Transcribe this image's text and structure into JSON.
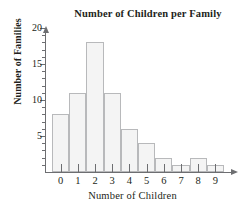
{
  "chart_data": {
    "type": "bar",
    "title": "Number of Children per Family",
    "xlabel": "Number of Children",
    "ylabel": "Number of Families",
    "categories": [
      "0",
      "1",
      "2",
      "3",
      "4",
      "5",
      "6",
      "7",
      "8",
      "9"
    ],
    "values": [
      8,
      11,
      18,
      11,
      6,
      4,
      2,
      1,
      2,
      1
    ],
    "ylim": [
      0,
      20
    ],
    "ytick_labels": [
      "5",
      "10",
      "15",
      "20"
    ],
    "ytick_values": [
      5,
      10,
      15,
      20
    ],
    "yminor_step": 1,
    "grid": false,
    "legend": null,
    "bar_fill_color": "#f4f4f4",
    "bar_border_color": "#b8b9bb",
    "axis_color": "#6d6e71",
    "text_color": "#231f20",
    "axis_arrows": true
  }
}
